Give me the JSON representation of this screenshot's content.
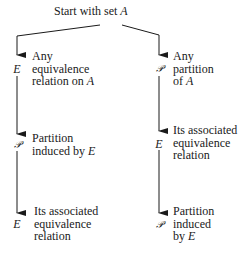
{
  "diagram": {
    "title": "Start with set",
    "title_var": "A",
    "left": {
      "steps": [
        {
          "symbol": "E",
          "lines": [
            "Any",
            "equivalence",
            "relation on"
          ],
          "var": "A"
        },
        {
          "symbol": "𝒫",
          "lines": [
            "Partition",
            "induced by"
          ],
          "var": "E"
        },
        {
          "symbol": "E",
          "lines": [
            "Its associated",
            "equivalence",
            "relation"
          ],
          "var": ""
        }
      ]
    },
    "right": {
      "steps": [
        {
          "symbol": "𝒫",
          "lines": [
            "Any",
            "partition",
            "of"
          ],
          "var": "A"
        },
        {
          "symbol": "E",
          "lines": [
            "Its associated",
            "equivalence",
            "relation"
          ],
          "var": ""
        },
        {
          "symbol": "𝒫",
          "lines": [
            "Partition",
            "induced",
            "by"
          ],
          "var": "E"
        }
      ]
    },
    "colors": {
      "ink": "#1a1a1a",
      "background": "#ffffff"
    }
  }
}
